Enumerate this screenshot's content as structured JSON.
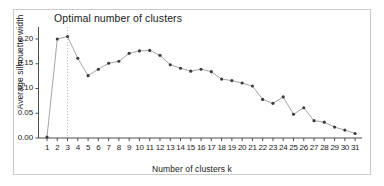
{
  "chart_data": {
    "type": "line",
    "title": "Optimal number of clusters",
    "xlabel": "Number of clusters k",
    "ylabel": "Average silhouette width",
    "categories": [
      1,
      2,
      3,
      4,
      5,
      6,
      7,
      8,
      9,
      10,
      11,
      12,
      13,
      14,
      15,
      16,
      17,
      18,
      19,
      20,
      21,
      22,
      23,
      24,
      25,
      26,
      27,
      28,
      29,
      30,
      31
    ],
    "x_tick_labels": [
      "1",
      "2",
      "3",
      "4",
      "5",
      "6",
      "7",
      "8",
      "9",
      "10",
      "11",
      "12",
      "13",
      "14",
      "15",
      "16",
      "17",
      "18",
      "19",
      "20",
      "21",
      "22",
      "23",
      "24",
      "25",
      "26",
      "27",
      "28",
      "29",
      "30",
      "31"
    ],
    "values": [
      0.002,
      0.2,
      0.205,
      0.161,
      0.126,
      0.139,
      0.151,
      0.155,
      0.171,
      0.176,
      0.177,
      0.167,
      0.148,
      0.141,
      0.135,
      0.139,
      0.134,
      0.119,
      0.116,
      0.111,
      0.105,
      0.078,
      0.07,
      0.083,
      0.048,
      0.061,
      0.035,
      0.032,
      0.022,
      0.016,
      0.009
    ],
    "y_tick_values": [
      0.0,
      0.05,
      0.1,
      0.15,
      0.2
    ],
    "y_tick_labels": [
      "0.00",
      "0.05",
      "0.10",
      "0.15",
      "0.20"
    ],
    "ylim": [
      -0.004,
      0.216
    ],
    "xlim": [
      0.5,
      31.5
    ],
    "grid": false,
    "legend": null,
    "annotations": [
      {
        "name": "optimal-k-line",
        "type": "vertical-dashed-line",
        "x": 3,
        "label": ""
      }
    ],
    "marker": "filled-circle",
    "marker_color": "#3a3a3a",
    "line_color": "#9a9a9a",
    "axis_color": "#4d4d4d",
    "dashed_line_color": "#bdbdbd",
    "background": "#ffffff",
    "frame_color": "#c9c9c9"
  }
}
